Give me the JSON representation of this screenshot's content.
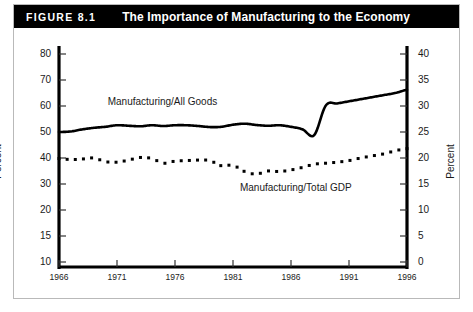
{
  "header": {
    "figure_number": "FIGURE 8.1",
    "title": "The Importance of Manufacturing to the Economy",
    "background_color": "#000000",
    "text_color": "#ffffff"
  },
  "chart_data": {
    "type": "line",
    "title": "The Importance of Manufacturing to the Economy",
    "xlabel": "",
    "ylabel": "Percent",
    "y2label": "Percent",
    "grid": false,
    "legend": "inline-annotations",
    "x": [
      1966,
      1967,
      1968,
      1969,
      1970,
      1971,
      1972,
      1973,
      1974,
      1975,
      1976,
      1977,
      1978,
      1979,
      1980,
      1981,
      1982,
      1983,
      1984,
      1985,
      1986,
      1987,
      1988,
      1989,
      1990,
      1991,
      1992,
      1993,
      1994,
      1995,
      1996
    ],
    "xlim": [
      1966,
      1996
    ],
    "xticks": [
      1966,
      1971,
      1976,
      1981,
      1986,
      1991,
      1996
    ],
    "xticklabels": [
      "1966",
      "1971",
      "1976",
      "1981",
      "1986",
      "1991",
      "1996"
    ],
    "ylim": [
      10,
      85
    ],
    "yticks": [
      10,
      15,
      20,
      30,
      40,
      50,
      60,
      70,
      80
    ],
    "yticklabels": [
      "10",
      "15",
      "20",
      "30",
      "40",
      "50",
      "60",
      "70",
      "80"
    ],
    "y2lim": [
      0,
      42.5
    ],
    "y2ticks": [
      0,
      5,
      10,
      15,
      20,
      25,
      30,
      35,
      40
    ],
    "y2ticklabels": [
      "0",
      "5",
      "10",
      "15",
      "20",
      "25",
      "30",
      "35",
      "40"
    ],
    "series": [
      {
        "name": "Manufacturing/All Goods",
        "axis": "left",
        "style": "solid",
        "color": "#000000",
        "label_position": {
          "x": 1970.2,
          "y": 61.5
        },
        "values": [
          50.0,
          50.2,
          51.0,
          51.6,
          52.0,
          52.6,
          52.4,
          52.2,
          52.6,
          52.3,
          52.6,
          52.6,
          52.3,
          51.9,
          52.0,
          52.8,
          53.2,
          52.7,
          52.4,
          52.6,
          52.0,
          51.0,
          48.8,
          47.4,
          47.6,
          48.8,
          49.6,
          49.8,
          53.2,
          58.8,
          59.2
        ]
      },
      {
        "name": "Manufacturing/Total GDP",
        "axis": "right",
        "style": "dotted",
        "color": "#000000",
        "label_position": {
          "x": 1981.6,
          "y": 14.3
        },
        "values": [
          19.9,
          19.7,
          19.8,
          20.0,
          19.3,
          19.2,
          19.6,
          20.1,
          19.9,
          19.0,
          19.4,
          19.5,
          19.6,
          19.5,
          18.5,
          18.6,
          17.4,
          16.9,
          17.5,
          17.4,
          17.7,
          18.2,
          18.8,
          19.0,
          19.2,
          19.5,
          20.0,
          20.4,
          20.8,
          21.4,
          21.8
        ]
      }
    ],
    "series_right_tail": {
      "note": "solid line continues rising after 1988 jump",
      "values_left_axis": [
        59.2,
        60.2,
        61.0,
        61.8,
        62.6,
        63.4,
        64.2,
        65.0,
        66.2
      ]
    }
  },
  "axes": {
    "left_title": "Percent",
    "right_title": "Percent"
  }
}
